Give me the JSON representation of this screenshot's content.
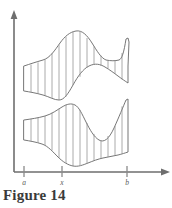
{
  "figure": {
    "caption": "Figure 14",
    "axes": {
      "x_axis_name": "horizontal-axis",
      "y_axis_name": "vertical-axis",
      "origin_x": 14,
      "baseline_y": 172,
      "x_axis_end": 168,
      "y_axis_top": 14,
      "axis_color": "#6e6e6e"
    },
    "ticks": [
      {
        "label": "a",
        "x": 24
      },
      {
        "label": "x",
        "x": 62
      },
      {
        "label": "b",
        "x": 127
      }
    ],
    "regions": [
      {
        "name": "upper-region",
        "outline_color": "#6f6f6f",
        "fill_color": "#ffffff",
        "hatch_color": "#8d8d8d",
        "upper_curve": "M 24,66 C 30,64 36,62 43,60 C 50,58 55,50 60,43 C 65,36 70,32 76,31 C 82,30 87,35 92,43 C 97,51 101,58 106,60 C 111,61 115,61 119,60 C 122,59 124,52 126,39 L 128,38 L 129,42 C 129,50 128,58 128,66",
        "lower_curve": "M 24,91 C 30,92 36,93 43,95 C 50,97 54,100 59,100 C 64,100 68,94 73,85 C 78,76 83,69 89,66 C 95,63 100,64 105,67 C 110,70 114,73 118,76 C 122,79 125,81 128,83",
        "left_cap": "M 24,66 L 24,91",
        "right_cap": "M 128,66 L 128,83",
        "hatch_x": [
          31,
          38,
          45,
          52,
          59,
          66,
          73,
          80,
          87,
          94,
          101,
          108,
          115,
          122
        ]
      },
      {
        "name": "lower-region",
        "outline_color": "#6f6f6f",
        "fill_color": "#ffffff",
        "hatch_color": "#8d8d8d",
        "upper_curve": "M 24,120 C 31,119 38,118 45,116 C 52,114 57,110 62,107 C 67,104 71,103 75,105 C 79,107 82,114 86,122 C 90,130 94,137 99,140 C 104,143 109,139 114,128 C 119,117 123,107 126,100 L 128,99",
        "lower_curve": "M 24,140 C 30,141 36,142 42,144 C 48,146 53,152 58,157 C 63,162 68,165 73,166 C 78,167 83,165 88,163 C 93,161 98,159 103,158 C 108,157 113,156 118,155 C 122,154 125,153 128,152",
        "left_cap": "M 24,120 L 24,140",
        "right_cap": "M 128,99 L 128,152",
        "hatch_x": [
          31,
          38,
          45,
          52,
          59,
          66,
          73,
          80,
          87,
          94,
          101,
          108,
          115,
          122
        ]
      }
    ]
  }
}
